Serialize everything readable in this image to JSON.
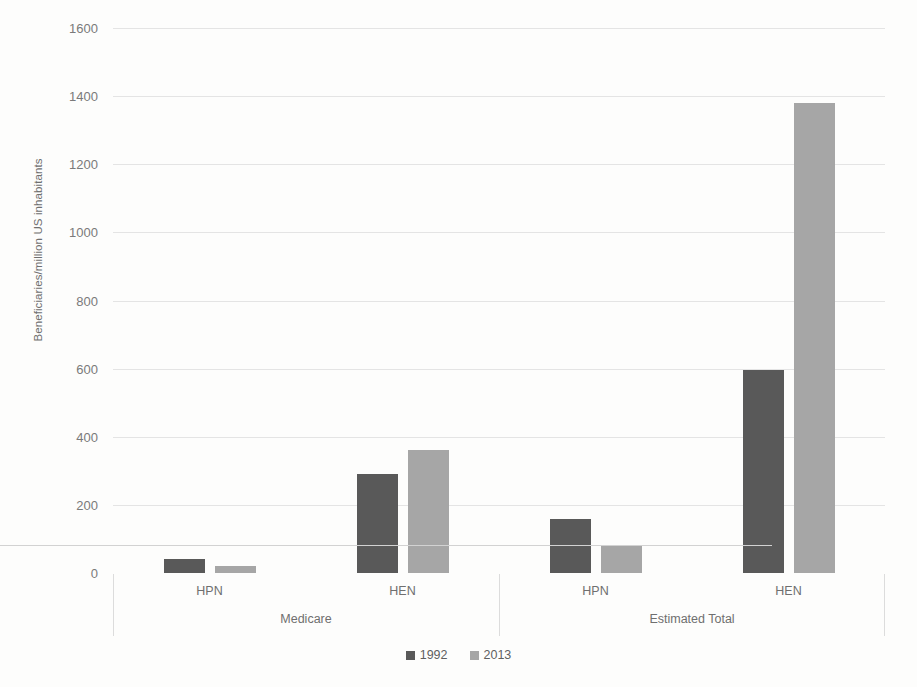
{
  "chart_data": {
    "type": "bar",
    "title": "",
    "xlabel": "",
    "ylabel": "Beneficiaries/million US inhabitants",
    "ylim": [
      0,
      1600
    ],
    "ytick_values": [
      0,
      200,
      400,
      600,
      800,
      1000,
      1200,
      1400,
      1600
    ],
    "ytick_labels": [
      "0",
      "200",
      "400",
      "600",
      "800",
      "1000",
      "1200",
      "1400",
      "1600"
    ],
    "grid": true,
    "legend_position": "bottom-center",
    "groups": [
      {
        "label": "Medicare",
        "categories": [
          "HPN",
          "HEN"
        ]
      },
      {
        "label": "Estimated Total",
        "categories": [
          "HPN",
          "HEN"
        ]
      }
    ],
    "categories": [
      "Medicare - HPN",
      "Medicare - HEN",
      "Estimated Total - HPN",
      "Estimated Total - HEN"
    ],
    "series": [
      {
        "name": "1992",
        "color": "#595959",
        "values": [
          40,
          290,
          160,
          595
        ]
      },
      {
        "name": "2013",
        "color": "#a6a6a6",
        "values": [
          20,
          362,
          80,
          1381
        ]
      }
    ]
  },
  "legend": {
    "items": [
      {
        "label": "1992",
        "color": "#595959"
      },
      {
        "label": "2013",
        "color": "#a6a6a6"
      }
    ]
  },
  "axis": {
    "y_title": "Beneficiaries/million US inhabitants"
  }
}
